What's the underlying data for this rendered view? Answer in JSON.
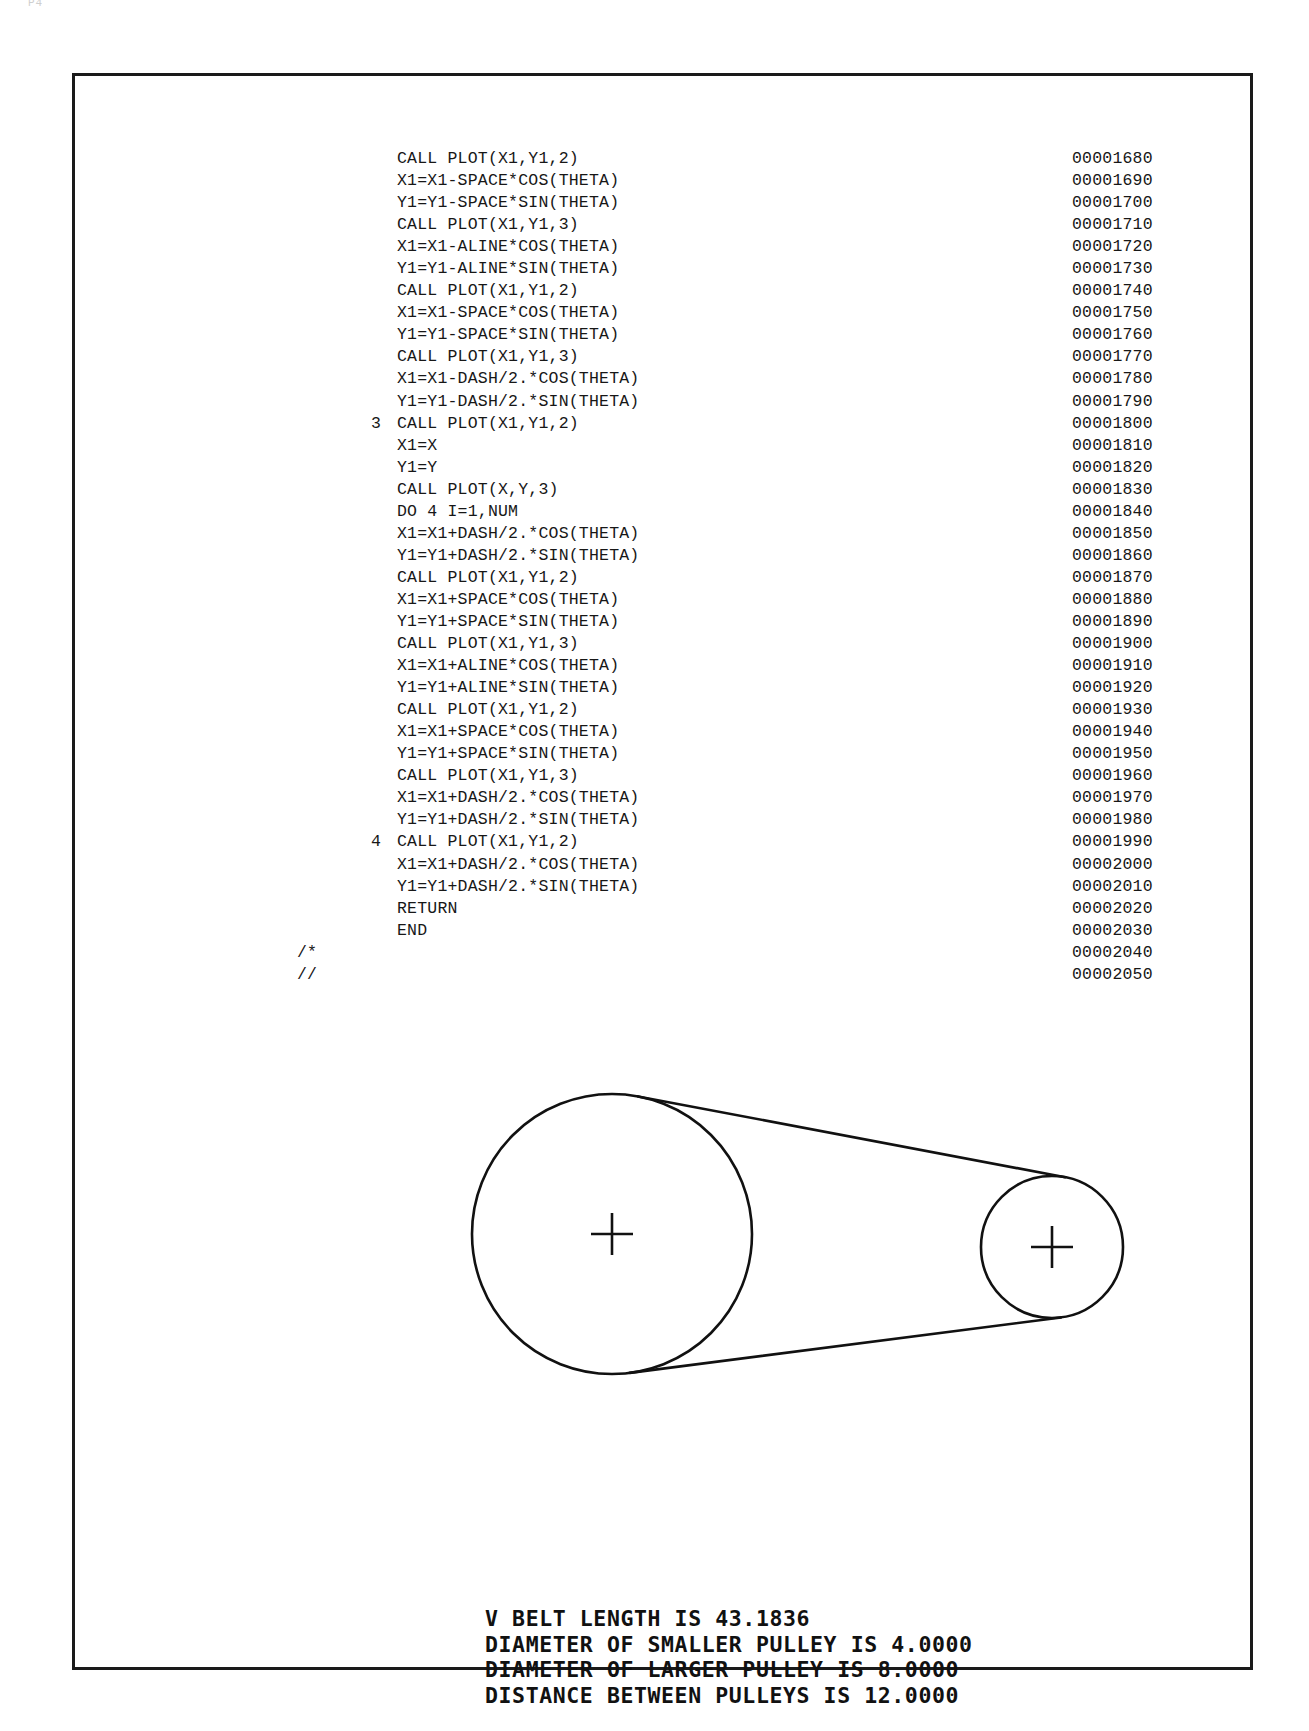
{
  "document": {
    "type": "computer-printout-listing",
    "scan_artifact_text": "P4",
    "border_color": "#1a1a1a",
    "page_background": "#ffffff"
  },
  "listing": {
    "font": "monospace",
    "text_color": "#171717",
    "lines": [
      {
        "label": "",
        "code": "CALL PLOT(X1,Y1,2)",
        "seq": "00001680"
      },
      {
        "label": "",
        "code": "X1=X1-SPACE*COS(THETA)",
        "seq": "00001690"
      },
      {
        "label": "",
        "code": "Y1=Y1-SPACE*SIN(THETA)",
        "seq": "00001700"
      },
      {
        "label": "",
        "code": "CALL PLOT(X1,Y1,3)",
        "seq": "00001710"
      },
      {
        "label": "",
        "code": "X1=X1-ALINE*COS(THETA)",
        "seq": "00001720"
      },
      {
        "label": "",
        "code": "Y1=Y1-ALINE*SIN(THETA)",
        "seq": "00001730"
      },
      {
        "label": "",
        "code": "CALL PLOT(X1,Y1,2)",
        "seq": "00001740"
      },
      {
        "label": "",
        "code": "X1=X1-SPACE*COS(THETA)",
        "seq": "00001750"
      },
      {
        "label": "",
        "code": "Y1=Y1-SPACE*SIN(THETA)",
        "seq": "00001760"
      },
      {
        "label": "",
        "code": "CALL PLOT(X1,Y1,3)",
        "seq": "00001770"
      },
      {
        "label": "",
        "code": "X1=X1-DASH/2.*COS(THETA)",
        "seq": "00001780"
      },
      {
        "label": "",
        "code": "Y1=Y1-DASH/2.*SIN(THETA)",
        "seq": "00001790"
      },
      {
        "label": "3",
        "code": "CALL PLOT(X1,Y1,2)",
        "seq": "00001800"
      },
      {
        "label": "",
        "code": "X1=X",
        "seq": "00001810"
      },
      {
        "label": "",
        "code": "Y1=Y",
        "seq": "00001820"
      },
      {
        "label": "",
        "code": "CALL PLOT(X,Y,3)",
        "seq": "00001830"
      },
      {
        "label": "",
        "code": "DO 4 I=1,NUM",
        "seq": "00001840"
      },
      {
        "label": "",
        "code": "X1=X1+DASH/2.*COS(THETA)",
        "seq": "00001850"
      },
      {
        "label": "",
        "code": "Y1=Y1+DASH/2.*SIN(THETA)",
        "seq": "00001860"
      },
      {
        "label": "",
        "code": "CALL PLOT(X1,Y1,2)",
        "seq": "00001870"
      },
      {
        "label": "",
        "code": "X1=X1+SPACE*COS(THETA)",
        "seq": "00001880"
      },
      {
        "label": "",
        "code": "Y1=Y1+SPACE*SIN(THETA)",
        "seq": "00001890"
      },
      {
        "label": "",
        "code": "CALL PLOT(X1,Y1,3)",
        "seq": "00001900"
      },
      {
        "label": "",
        "code": "X1=X1+ALINE*COS(THETA)",
        "seq": "00001910"
      },
      {
        "label": "",
        "code": "Y1=Y1+ALINE*SIN(THETA)",
        "seq": "00001920"
      },
      {
        "label": "",
        "code": "CALL PLOT(X1,Y1,2)",
        "seq": "00001930"
      },
      {
        "label": "",
        "code": "X1=X1+SPACE*COS(THETA)",
        "seq": "00001940"
      },
      {
        "label": "",
        "code": "Y1=Y1+SPACE*SIN(THETA)",
        "seq": "00001950"
      },
      {
        "label": "",
        "code": "CALL PLOT(X1,Y1,3)",
        "seq": "00001960"
      },
      {
        "label": "",
        "code": "X1=X1+DASH/2.*COS(THETA)",
        "seq": "00001970"
      },
      {
        "label": "",
        "code": "Y1=Y1+DASH/2.*SIN(THETA)",
        "seq": "00001980"
      },
      {
        "label": "4",
        "code": "CALL PLOT(X1,Y1,2)",
        "seq": "00001990"
      },
      {
        "label": "",
        "code": "X1=X1+DASH/2.*COS(THETA)",
        "seq": "00002000"
      },
      {
        "label": "",
        "code": "Y1=Y1+DASH/2.*SIN(THETA)",
        "seq": "00002010"
      },
      {
        "label": "",
        "code": "RETURN",
        "seq": "00002020"
      },
      {
        "label": "",
        "code": "END",
        "seq": "00002030"
      },
      {
        "label": "",
        "code": "",
        "jcl": "/*",
        "seq": "00002040"
      },
      {
        "label": "",
        "code": "",
        "jcl": "//",
        "seq": "00002050"
      }
    ]
  },
  "plot": {
    "title": "v-belt two-pulley layout",
    "stroke_color": "#111111",
    "large_pulley": {
      "cx": 537,
      "cy": 1158,
      "r": 140,
      "center_mark": "+"
    },
    "small_pulley": {
      "cx": 977,
      "cy": 1171,
      "r": 71,
      "center_mark": "+"
    },
    "belt": "open belt tangent lines between pulleys"
  },
  "plot_text": {
    "lines": [
      "V BELT LENGTH IS 43.1836",
      "DIAMETER OF SMALLER PULLEY IS 4.0000",
      "DIAMETER OF LARGER PULLEY IS 8.0000",
      "DISTANCE BETWEEN PULLEYS IS 12.0000"
    ],
    "values": {
      "v_belt_length": "43.1836",
      "diameter_smaller_pulley": "4.0000",
      "diameter_larger_pulley": "8.0000",
      "distance_between_pulleys": "12.0000"
    }
  }
}
